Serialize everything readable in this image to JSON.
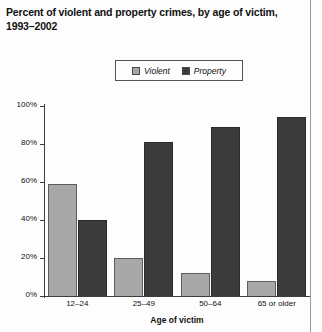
{
  "chart_data": {
    "type": "bar",
    "title": "Percent of violent and property crimes, by age of victim, 1993–2002",
    "xlabel": "Age of victim",
    "ylabel": "",
    "categories": [
      "12–24",
      "25–49",
      "50–64",
      "65 or older"
    ],
    "series": [
      {
        "name": "Violent",
        "color": "#a8a8a8",
        "values": [
          59,
          20,
          12,
          8
        ]
      },
      {
        "name": "Property",
        "color": "#3b3b3b",
        "values": [
          40,
          81,
          89,
          94
        ]
      }
    ],
    "ylim": [
      0,
      100
    ],
    "ytick_values": [
      0,
      20,
      40,
      60,
      80,
      100
    ],
    "ytick_labels": [
      "0%",
      "20%",
      "40%",
      "60%",
      "80%",
      "100%"
    ],
    "grid": false,
    "legend_position": "top-center"
  },
  "legend": {
    "items": [
      {
        "label": "Violent",
        "swatch": "#a8a8a8"
      },
      {
        "label": "Property",
        "swatch": "#3b3b3b"
      }
    ]
  }
}
